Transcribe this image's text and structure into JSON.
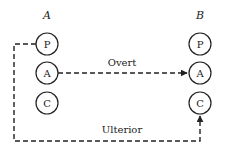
{
  "diagram": {
    "left_label": "A",
    "right_label": "B",
    "left_states": [
      "P",
      "A",
      "C"
    ],
    "right_states": [
      "P",
      "A",
      "C"
    ],
    "overt_label": "Overt",
    "ulterior_label": "Ulterior",
    "line_color": "#222222"
  }
}
